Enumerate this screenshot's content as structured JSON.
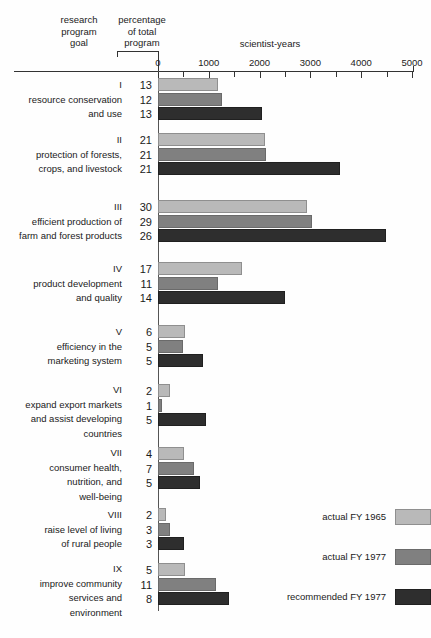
{
  "header": {
    "col_goal": "research\nprogram\ngoal",
    "col_percentage": "percentage\nof total\nprogram",
    "axis_title": "scientist-years"
  },
  "legend": {
    "position": "bottom-right",
    "items": [
      {
        "label": "actual FY 1965",
        "color": "#b9b9b9",
        "swatch": "c1"
      },
      {
        "label": "actual FY 1977",
        "color": "#808080",
        "swatch": "c2"
      },
      {
        "label": "recommended FY 1977",
        "color": "#2e2e2e",
        "swatch": "c3"
      }
    ]
  },
  "chart_data": {
    "type": "bar",
    "orientation": "horizontal",
    "title": "",
    "subtitle": "",
    "xlabel": "scientist-years",
    "ylabel": "research program goal",
    "xlim": [
      0,
      5000
    ],
    "xticks": [
      0,
      1000,
      2000,
      3000,
      4000,
      5000
    ],
    "xtick_labels": [
      "0",
      "1000",
      "2000",
      "3000",
      "4000",
      "5000"
    ],
    "minor_tick_interval": 500,
    "grid": false,
    "categories": [
      "I resource conservation and use",
      "II protection of forests, crops, and livestock",
      "III efficient production of farm and forest products",
      "IV product development and quality",
      "V efficiency in the marketing system",
      "VI expand export markets and assist developing countries",
      "VII consumer health, nutrition, and well-being",
      "VIII raise level of living of rural people",
      "IX improve community services and environment"
    ],
    "series": [
      {
        "name": "actual FY 1965",
        "color": "#b9b9b9",
        "values": [
          1180,
          2100,
          2930,
          1650,
          530,
          240,
          510,
          160,
          530
        ]
      },
      {
        "name": "actual FY 1977",
        "color": "#808080",
        "values": [
          1260,
          2120,
          3030,
          1180,
          490,
          80,
          710,
          240,
          1140
        ]
      },
      {
        "name": "recommended FY 1977",
        "color": "#2e2e2e",
        "values": [
          2050,
          3580,
          4490,
          2500,
          890,
          950,
          830,
          510,
          1400
        ]
      }
    ],
    "percentage_series": [
      {
        "name": "actual FY 1965",
        "values": [
          13,
          21,
          30,
          17,
          6,
          2,
          4,
          2,
          5
        ]
      },
      {
        "name": "actual FY 1977",
        "values": [
          12,
          21,
          29,
          11,
          5,
          1,
          7,
          3,
          11
        ]
      },
      {
        "name": "recommended FY 1977",
        "values": [
          13,
          21,
          26,
          14,
          5,
          5,
          5,
          3,
          8
        ]
      }
    ]
  },
  "groups": [
    {
      "roman": "I",
      "name_lines": [
        "resource conservation",
        "and use"
      ],
      "percentages": [
        "13",
        "12",
        "13"
      ],
      "values": [
        1180,
        1260,
        2050
      ]
    },
    {
      "roman": "II",
      "name_lines": [
        "protection of forests,",
        "crops, and livestock"
      ],
      "percentages": [
        "21",
        "21",
        "21"
      ],
      "values": [
        2100,
        2120,
        3580
      ]
    },
    {
      "roman": "III",
      "name_lines": [
        "efficient production of",
        "farm and forest products"
      ],
      "percentages": [
        "30",
        "29",
        "26"
      ],
      "values": [
        2930,
        3030,
        4490
      ]
    },
    {
      "roman": "IV",
      "name_lines": [
        "product development",
        "and quality"
      ],
      "percentages": [
        "17",
        "11",
        "14"
      ],
      "values": [
        1650,
        1180,
        2500
      ]
    },
    {
      "roman": "V",
      "name_lines": [
        "efficiency in the",
        "marketing system"
      ],
      "percentages": [
        "6",
        "5",
        "5"
      ],
      "values": [
        530,
        490,
        890
      ]
    },
    {
      "roman": "VI",
      "name_lines": [
        "expand export markets",
        "and assist developing",
        "countries"
      ],
      "percentages": [
        "2",
        "1",
        "5"
      ],
      "values": [
        240,
        80,
        950
      ]
    },
    {
      "roman": "VII",
      "name_lines": [
        "consumer health,",
        "nutrition, and",
        "well-being"
      ],
      "percentages": [
        "4",
        "7",
        "5"
      ],
      "values": [
        510,
        710,
        830
      ]
    },
    {
      "roman": "VIII",
      "name_lines": [
        "raise level of living",
        "of rural people"
      ],
      "percentages": [
        "2",
        "3",
        "3"
      ],
      "values": [
        160,
        240,
        510
      ]
    },
    {
      "roman": "IX",
      "name_lines": [
        "improve community",
        "services and",
        "environment"
      ],
      "percentages": [
        "5",
        "11",
        "8"
      ],
      "values": [
        530,
        1140,
        1400
      ]
    }
  ]
}
